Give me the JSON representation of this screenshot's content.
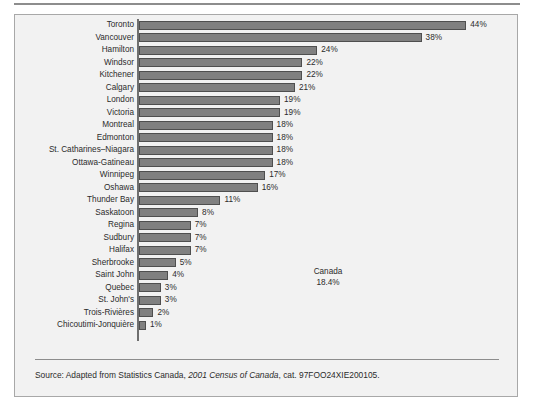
{
  "chart_data": {
    "type": "bar",
    "orientation": "horizontal",
    "title": "",
    "subtitle": "",
    "xlabel": "",
    "ylabel": "",
    "xlim": [
      0,
      46
    ],
    "grid": false,
    "legend": null,
    "value_suffix": "%",
    "categories": [
      "Toronto",
      "Vancouver",
      "Hamilton",
      "Windsor",
      "Kitchener",
      "Calgary",
      "London",
      "Victoria",
      "Montreal",
      "Edmonton",
      "St. Catharines–Niagara",
      "Ottawa-Gatineau",
      "Winnipeg",
      "Oshawa",
      "Thunder Bay",
      "Saskatoon",
      "Regina",
      "Sudbury",
      "Halifax",
      "Sherbrooke",
      "Saint John",
      "Quebec",
      "St. John's",
      "Trois-Rivières",
      "Chicoutimi-Jonquière"
    ],
    "values": [
      44,
      38,
      24,
      22,
      22,
      21,
      19,
      19,
      18,
      18,
      18,
      18,
      17,
      16,
      11,
      8,
      7,
      7,
      7,
      5,
      4,
      3,
      3,
      2,
      1
    ],
    "value_labels": [
      "44%",
      "38%",
      "24%",
      "22%",
      "22%",
      "21%",
      "19%",
      "19%",
      "18%",
      "18%",
      "18%",
      "18%",
      "17%",
      "16%",
      "11%",
      "8%",
      "7%",
      "7%",
      "7%",
      "5%",
      "4%",
      "3%",
      "3%",
      "2%",
      "1%"
    ],
    "annotations": [
      {
        "label": "Canada",
        "value_label": "18.4%",
        "value": 18.4
      }
    ],
    "colors": {
      "bar_fill": "#808080",
      "bar_stroke": "#4f4f4f",
      "panel_background": "#f2f2f2",
      "panel_border": "#a8a8a8",
      "text": "#2b2b2b",
      "axis": "#6f6f6f"
    }
  },
  "annotation": {
    "name": "Canada",
    "value": "18.4%"
  },
  "source": {
    "prefix": "Source: Adapted from Statistics Canada, ",
    "italic": "2001 Census of Canada",
    "suffix": ", cat. 97FOO24XIE200105."
  }
}
